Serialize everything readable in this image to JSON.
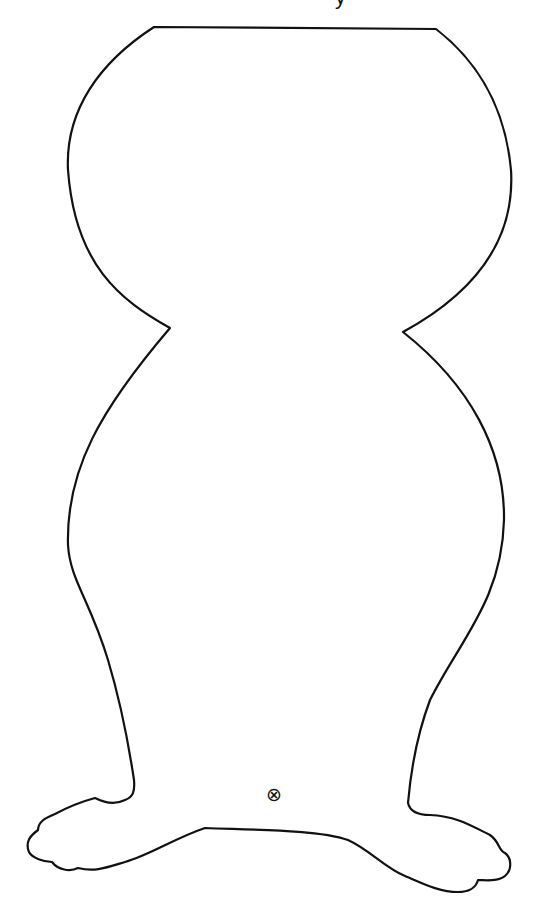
{
  "page": {
    "background": "#ffffff",
    "line_color": "#111111"
  },
  "header": {
    "cutoff_text": "y"
  },
  "figure": {
    "parts": [
      "head",
      "neck-pinch",
      "body",
      "legs",
      "left-foot",
      "right-foot"
    ]
  },
  "marker": {
    "symbol": "⊗",
    "icon": "circled-x-mark"
  }
}
